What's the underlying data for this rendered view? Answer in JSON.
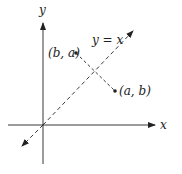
{
  "diagram": {
    "axes": {
      "x_label": "x",
      "y_label": "y"
    },
    "line": {
      "label": "y = x",
      "style": "dashed"
    },
    "points": [
      {
        "label": "(b, a)"
      },
      {
        "label": "(a, b)"
      }
    ],
    "colors": {
      "stroke": "#222222",
      "background": "#ffffff"
    }
  }
}
